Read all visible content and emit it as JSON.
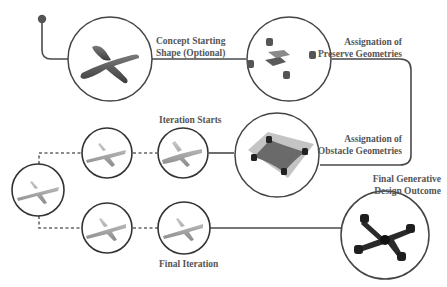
{
  "diagram": {
    "colors": {
      "line": "#4a4a4a",
      "circle_stroke": "#444444",
      "label_text": "#555555",
      "model_dark": "#505050",
      "model_light": "#9a9a9a"
    },
    "stages": [
      {
        "id": "concept",
        "label_line1": "Concept Starting",
        "label_line2": "Shape (Optional)"
      },
      {
        "id": "preserve",
        "label_line1": "Assignation of",
        "label_line2": "Preserve Geometries"
      },
      {
        "id": "obstacle",
        "label_line1": "Assignation of",
        "label_line2": "Obstacle Geometries"
      },
      {
        "id": "iteration_starts",
        "label": "Iteration Starts"
      },
      {
        "id": "final_iteration",
        "label": "Final Iteration"
      },
      {
        "id": "final_outcome",
        "label_line1": "Final Generative",
        "label_line2": "Design Outcome"
      }
    ]
  }
}
